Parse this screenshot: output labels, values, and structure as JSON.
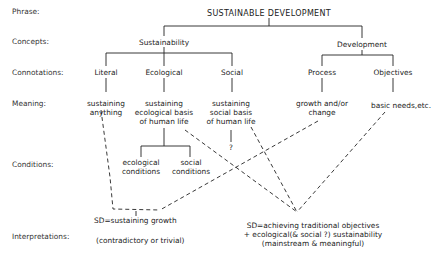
{
  "row_labels": {
    "phrase": "Phrase:",
    "concepts": "Concepts:",
    "connotations": "Connotations:",
    "meaning": "Meaning:",
    "conditions": "Conditions:",
    "interpretations": "Interpretations:"
  },
  "phrase": "SUSTAINABLE DEVELOPMENT",
  "concepts": {
    "sustainability": "Sustainability",
    "development": "Development"
  },
  "connotations": {
    "literal": "Literal",
    "ecological": "Ecological",
    "social": "Social",
    "process": "Process",
    "objectives": "Objectives"
  },
  "meaning": {
    "literal": [
      "sustaining",
      "anything"
    ],
    "ecological": [
      "sustaining",
      "ecological basis",
      "of human life"
    ],
    "social": [
      "sustaining",
      "social basis",
      "of human life"
    ],
    "social_unknown": "?",
    "process": [
      "growth and/or",
      "change"
    ],
    "objectives": "basic needs,etc."
  },
  "conditions": {
    "ecological": [
      "ecological",
      "conditions"
    ],
    "social": [
      "social",
      "conditions"
    ]
  },
  "interpretations": {
    "left": {
      "title": "SD=sustaining growth",
      "note": "(contradictory or trivial)"
    },
    "right": {
      "line1": "SD=achieving traditional objectives",
      "line2": "+ ecological(& social ?) sustainability",
      "line3": "(mainstream & meaningful)"
    }
  }
}
